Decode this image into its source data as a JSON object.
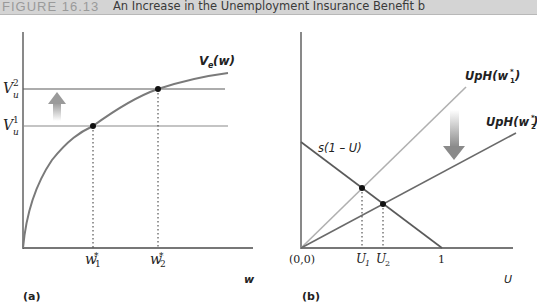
{
  "header": {
    "figure_number": "FIGURE 16.13",
    "caption": "An Increase in the Unemployment Insurance Benefit b"
  },
  "panel_a": {
    "label": "(a)",
    "x_axis_label": "w",
    "curve_label_main": "V",
    "curve_label_sub": "e",
    "curve_label_tail": "(w)",
    "y_ticks": [
      {
        "base": "V",
        "sub": "u",
        "sup": "2"
      },
      {
        "base": "V",
        "sub": "u",
        "sup": "1"
      }
    ],
    "x_ticks": [
      {
        "base": "w",
        "sub": "1",
        "sup": "*"
      },
      {
        "base": "w",
        "sub": "2",
        "sup": "*"
      }
    ],
    "arrow": "up-arrow"
  },
  "panel_b": {
    "label": "(b)",
    "x_axis_label": "U",
    "origin_label": "(0,0)",
    "one_label": "1",
    "s_label": "s(1 – U)",
    "line1_label_pre": "UpH(w",
    "line1_label_sub": "1",
    "line1_label_sup": "*",
    "line1_label_post": ")",
    "line2_label_pre": "UpH(w",
    "line2_label_sub": "2",
    "line2_label_sup": "*",
    "line2_label_post": ")",
    "x_ticks": [
      {
        "base": "U",
        "sub": "1"
      },
      {
        "base": "U",
        "sub": "2"
      }
    ],
    "arrow": "down-arrow"
  },
  "colors": {
    "axis": "#4a4a4a",
    "curve": "#7a7a7a",
    "light_line": "#b0b0b0",
    "dark_line": "#6a6a6a",
    "point": "#111111",
    "title_bg": "#d4d4d4"
  }
}
